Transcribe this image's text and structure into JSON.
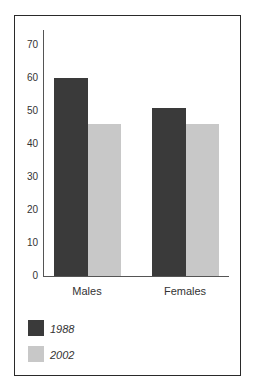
{
  "chart_data": {
    "type": "bar",
    "title": "",
    "xlabel": "",
    "ylabel": "",
    "categories": [
      "Males",
      "Females"
    ],
    "series": [
      {
        "name": "1988",
        "values": [
          60,
          51
        ],
        "color": "#3a3a3a"
      },
      {
        "name": "2002",
        "values": [
          46,
          46
        ],
        "color": "#c8c8c8"
      }
    ],
    "yticks": [
      "0",
      "10",
      "20",
      "30",
      "40",
      "50",
      "60",
      "70"
    ],
    "ylim": [
      0,
      75
    ],
    "grid": false,
    "legend_position": "bottom-left"
  }
}
